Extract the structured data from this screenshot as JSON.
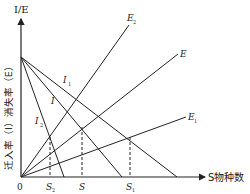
{
  "diagram": {
    "y_axis_label": "I/E",
    "y_axis_side_label": "迁入率（I）消失率（E）",
    "x_axis_label": "S物种数",
    "origin_label": "0",
    "immigration_lines": [
      {
        "name": "I1",
        "label": "I",
        "sub": "1"
      },
      {
        "name": "I",
        "label": "I",
        "sub": ""
      },
      {
        "name": "I2",
        "label": "I",
        "sub": "2"
      }
    ],
    "extinction_lines": [
      {
        "name": "E2",
        "label": "E",
        "sub": "2"
      },
      {
        "name": "E",
        "label": "E",
        "sub": ""
      },
      {
        "name": "E1",
        "label": "E",
        "sub": "1"
      }
    ],
    "equilibrium_points": [
      {
        "name": "S2",
        "label": "S",
        "sub": "2"
      },
      {
        "name": "S",
        "label": "S",
        "sub": ""
      },
      {
        "name": "S1",
        "label": "S",
        "sub": "1"
      }
    ],
    "line_color": "#222222"
  }
}
